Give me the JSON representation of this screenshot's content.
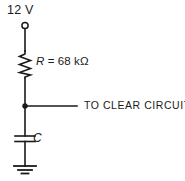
{
  "diagram": {
    "background_color": "#ffffff",
    "line_color": "#1a1a1a",
    "text_color": "#1a1a1a"
  },
  "labels": {
    "supply_voltage": "12 V",
    "resistor_symbol": "R",
    "resistor_equals": " = ",
    "resistor_value": "68 kΩ",
    "resistor_full": "R = 68 kΩ",
    "capacitor_symbol": "C",
    "output_destination": "TO CLEAR CIRCUITRY"
  },
  "components": {
    "supply_terminal": {
      "type": "open-terminal",
      "label": "12 V",
      "cx": 25,
      "cy": 25,
      "r": 3
    },
    "resistor": {
      "type": "resistor-zigzag",
      "designator": "R",
      "value": "68 kΩ",
      "x": 25,
      "y_top": 51,
      "y_bottom": 78
    },
    "junction": {
      "type": "node-dot",
      "cx": 25,
      "cy": 106,
      "r": 2.6
    },
    "capacitor": {
      "type": "capacitor-nonpolarized",
      "designator": "C",
      "value": "",
      "x": 25,
      "plate_top_y": 136,
      "plate_bottom_y": 141,
      "plate_half_width": 10
    },
    "ground": {
      "type": "earth-ground",
      "x": 25,
      "y_top": 166,
      "bars": [
        11,
        7,
        3.5
      ]
    },
    "output_wire": {
      "type": "wire-horizontal",
      "x_start": 25,
      "x_end": 77,
      "y": 106,
      "label": "TO CLEAR CIRCUITRY"
    }
  },
  "nets": [
    {
      "name": "supply-to-resistor",
      "from": "supply_terminal",
      "to": "resistor"
    },
    {
      "name": "resistor-to-junction",
      "from": "resistor",
      "to": "junction"
    },
    {
      "name": "junction-to-capacitor",
      "from": "junction",
      "to": "capacitor"
    },
    {
      "name": "capacitor-to-ground",
      "from": "capacitor",
      "to": "ground"
    },
    {
      "name": "junction-to-output",
      "from": "junction",
      "to": "output_wire"
    }
  ]
}
